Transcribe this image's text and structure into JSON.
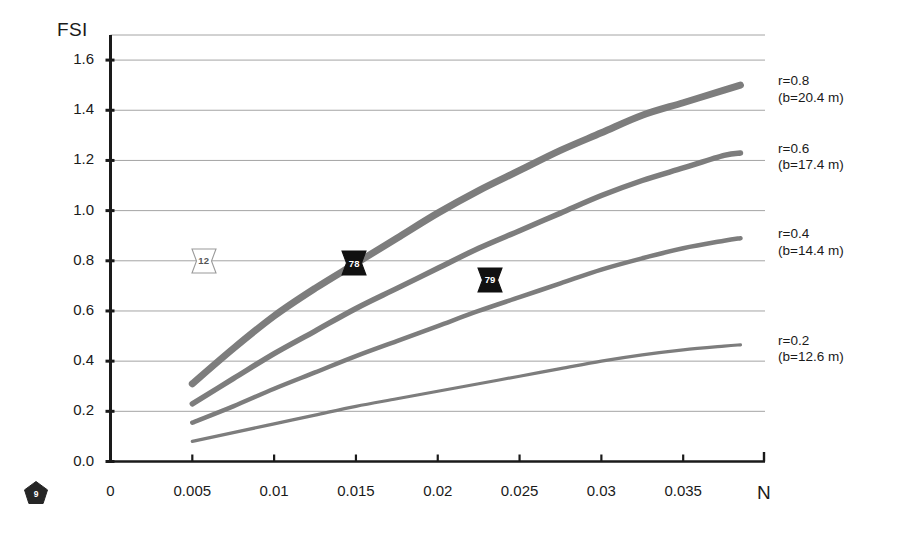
{
  "chart_data": {
    "type": "line",
    "title": "",
    "xlabel": "N",
    "ylabel": "FSI",
    "xlim": [
      0,
      0.04
    ],
    "ylim": [
      0.0,
      1.7
    ],
    "grid": true,
    "legend_position": "right-of-axes",
    "xticks": [
      "0",
      "0.005",
      "0.01",
      "0.015",
      "0.02",
      "0.025",
      "0.03",
      "0.035"
    ],
    "xtick_values": [
      0,
      0.005,
      0.01,
      0.015,
      0.02,
      0.025,
      0.03,
      0.035
    ],
    "yticks": [
      "0.0",
      "0.2",
      "0.4",
      "0.6",
      "0.8",
      "1.0",
      "1.2",
      "1.4",
      "1.6"
    ],
    "ytick_values": [
      0.0,
      0.2,
      0.4,
      0.6,
      0.8,
      1.0,
      1.2,
      1.4,
      1.6
    ],
    "series": [
      {
        "name": "r=0.8",
        "label_line1": "r=0.8",
        "label_line2": "(b=20.4 m)",
        "r": 0.8,
        "b": "20.4 m",
        "color": "#7d7d7d",
        "width": 7,
        "x": [
          0.005,
          0.0075,
          0.01,
          0.0125,
          0.015,
          0.0175,
          0.02,
          0.0225,
          0.025,
          0.0275,
          0.03,
          0.0325,
          0.035,
          0.0375,
          0.0385
        ],
        "y": [
          0.31,
          0.45,
          0.58,
          0.69,
          0.79,
          0.89,
          0.99,
          1.08,
          1.16,
          1.24,
          1.31,
          1.38,
          1.43,
          1.48,
          1.5
        ]
      },
      {
        "name": "r=0.6",
        "label_line1": "r=0.6",
        "label_line2": "(b=17.4 m)",
        "r": 0.6,
        "b": "17.4 m",
        "color": "#7d7d7d",
        "width": 5.5,
        "x": [
          0.005,
          0.0075,
          0.01,
          0.0125,
          0.015,
          0.0175,
          0.02,
          0.0225,
          0.025,
          0.0275,
          0.03,
          0.0325,
          0.035,
          0.0375,
          0.0385
        ],
        "y": [
          0.23,
          0.33,
          0.43,
          0.52,
          0.61,
          0.69,
          0.77,
          0.85,
          0.92,
          0.99,
          1.06,
          1.12,
          1.17,
          1.22,
          1.23
        ]
      },
      {
        "name": "r=0.4",
        "label_line1": "r=0.4",
        "label_line2": "(b=14.4 m)",
        "r": 0.4,
        "b": "14.4 m",
        "color": "#7d7d7d",
        "width": 4.5,
        "x": [
          0.005,
          0.0075,
          0.01,
          0.0125,
          0.015,
          0.0175,
          0.02,
          0.0225,
          0.025,
          0.0275,
          0.03,
          0.0325,
          0.035,
          0.0375,
          0.0385
        ],
        "y": [
          0.155,
          0.22,
          0.29,
          0.355,
          0.42,
          0.48,
          0.54,
          0.6,
          0.655,
          0.71,
          0.765,
          0.81,
          0.85,
          0.88,
          0.89
        ]
      },
      {
        "name": "r=0.2",
        "label_line1": "r=0.2",
        "label_line2": "(b=12.6 m)",
        "r": 0.2,
        "b": "12.6 m",
        "color": "#7d7d7d",
        "width": 3.2,
        "x": [
          0.005,
          0.0075,
          0.01,
          0.0125,
          0.015,
          0.0175,
          0.02,
          0.0225,
          0.025,
          0.0275,
          0.03,
          0.0325,
          0.035,
          0.0375,
          0.0385
        ],
        "y": [
          0.08,
          0.115,
          0.15,
          0.185,
          0.22,
          0.25,
          0.28,
          0.31,
          0.34,
          0.37,
          0.4,
          0.425,
          0.445,
          0.46,
          0.465
        ]
      }
    ],
    "annotations": [
      {
        "text": "12",
        "x": 0.0057,
        "y": 0.8,
        "style": "light"
      },
      {
        "text": "78",
        "x": 0.0149,
        "y": 0.79,
        "style": "dark"
      },
      {
        "text": "79",
        "x": 0.0232,
        "y": 0.725,
        "style": "dark"
      }
    ]
  },
  "page_badge": {
    "number": "9"
  }
}
